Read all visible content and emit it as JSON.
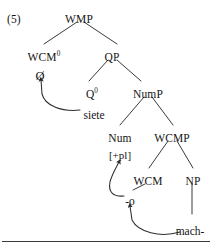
{
  "figure": {
    "example_number": "(5)",
    "caption": ""
  },
  "tree": {
    "nodes": [
      {
        "id": "wmp",
        "label": "WMP",
        "sup": "",
        "x": 79,
        "y": 14
      },
      {
        "id": "wcm0",
        "label": "WCM",
        "sup": "0",
        "x": 44,
        "y": 52
      },
      {
        "id": "qp",
        "label": "QP",
        "sup": "",
        "x": 112,
        "y": 52
      },
      {
        "id": "q0",
        "label": "Q",
        "sup": "0",
        "x": 92,
        "y": 89
      },
      {
        "id": "nump",
        "label": "NumP",
        "sup": "",
        "x": 148,
        "y": 89
      },
      {
        "id": "num",
        "label": "Num",
        "sup": "",
        "x": 120,
        "y": 133
      },
      {
        "id": "wcmp",
        "label": "WCMP",
        "sup": "",
        "x": 172,
        "y": 133
      },
      {
        "id": "wcm",
        "label": "WCM",
        "sup": "",
        "x": 148,
        "y": 176
      },
      {
        "id": "np",
        "label": "NP",
        "sup": "",
        "x": 193,
        "y": 176
      }
    ],
    "features": [
      {
        "id": "num-feat",
        "label": "[+pl]",
        "x": 120,
        "y": 150
      }
    ],
    "terminals": [
      {
        "id": "null-wcm",
        "label": "Ø",
        "x": 40,
        "y": 70,
        "kind": "null"
      },
      {
        "id": "siete",
        "label": "siete",
        "x": 94,
        "y": 110,
        "kind": "word"
      },
      {
        "id": "suffix-o",
        "label": "-o",
        "x": 130,
        "y": 196,
        "kind": "word"
      },
      {
        "id": "mach",
        "label": "mach-",
        "x": 190,
        "y": 226,
        "kind": "word"
      }
    ],
    "branches": [
      {
        "from": "wmp",
        "to": "wcm0",
        "x1": 77,
        "y1": 22,
        "x2": 44,
        "y2": 44
      },
      {
        "from": "wmp",
        "to": "qp",
        "x1": 84,
        "y1": 22,
        "x2": 117,
        "y2": 44
      },
      {
        "from": "qp",
        "to": "q0",
        "x1": 108,
        "y1": 60,
        "x2": 89,
        "y2": 81
      },
      {
        "from": "qp",
        "to": "nump",
        "x1": 117,
        "y1": 60,
        "x2": 141,
        "y2": 81
      },
      {
        "from": "nump",
        "to": "num",
        "x1": 144,
        "y1": 97,
        "x2": 120,
        "y2": 125
      },
      {
        "from": "nump",
        "to": "wcmp",
        "x1": 152,
        "y1": 97,
        "x2": 173,
        "y2": 125
      },
      {
        "from": "wcmp",
        "to": "wcm",
        "x1": 168,
        "y1": 141,
        "x2": 149,
        "y2": 168
      },
      {
        "from": "wcmp",
        "to": "np",
        "x1": 177,
        "y1": 141,
        "x2": 193,
        "y2": 168
      },
      {
        "from": "np",
        "to": "mach",
        "x1": 192,
        "y1": 184,
        "x2": 192,
        "y2": 214
      },
      {
        "from": "wcm",
        "to": "suffix-o",
        "x1": 145,
        "y1": 184,
        "x2": 133,
        "y2": 190
      }
    ],
    "movement_arrows": [
      {
        "id": "siete-to-null",
        "source": "siete",
        "target": "null-wcm",
        "path": "M 80 110 C 62 112, 45 106, 42 94 L 41 80"
      },
      {
        "id": "suffix-to-num",
        "source": "suffix-o",
        "target": "num",
        "path": "M 124 196 C 113 197, 108 192, 110 182 C 112 174, 116 168, 119 162"
      },
      {
        "id": "mach-to-suffix",
        "source": "mach",
        "target": "suffix-o",
        "path": "M 180 232 C 160 238, 138 232, 132 220 L 130 206"
      }
    ],
    "colors": {
      "line": "#2e2e2e",
      "text": "#151515",
      "rule": "#3b3b3b"
    }
  }
}
